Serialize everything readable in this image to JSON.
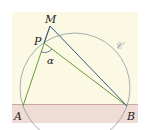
{
  "figure": {
    "colors": {
      "background": "#ffffff",
      "panel": "#fbf8e4",
      "band": "#efdcd4",
      "band_line": "#c9a79e",
      "circle": "#8c9aa3",
      "green_lines": "#6a9a3e",
      "blue_lines": "#3c5a88",
      "angle_arc": "#3c5a88"
    },
    "points": {
      "A": {
        "label": "A",
        "x": 23,
        "y": 106
      },
      "B": {
        "label": "B",
        "x": 127,
        "y": 106
      },
      "M": {
        "label": "M",
        "x": 50,
        "y": 26
      },
      "P": {
        "label": "P",
        "x": 44,
        "y": 43
      }
    },
    "circle": {
      "label": "𝒞",
      "cx": 75,
      "cy": 88,
      "r": 55
    },
    "angle": {
      "label": "α",
      "vertex": "P"
    },
    "segments": [
      {
        "from": "A",
        "to": "M",
        "color": "green"
      },
      {
        "from": "P",
        "to": "B",
        "color": "green"
      },
      {
        "from": "M",
        "to": "B",
        "color": "blue"
      },
      {
        "from": "P",
        "to": "M",
        "color": "blue"
      }
    ]
  }
}
